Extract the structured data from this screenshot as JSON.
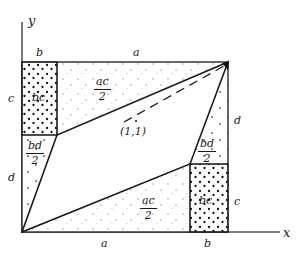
{
  "figure": {
    "axes": {
      "x_label": "x",
      "y_label": "y"
    },
    "point_label": "(1,1)",
    "edge_labels": {
      "top_left": "b",
      "top_right": "a",
      "bottom_left": "a",
      "bottom_right": "b",
      "left_upper": "c",
      "left_lower": "d",
      "right_upper": "d",
      "right_lower": "c"
    },
    "region_labels": {
      "top_left_block": "bc",
      "bottom_right_block": "bc",
      "top_triangle_num": "ac",
      "top_triangle_den": "2",
      "bottom_triangle_num": "ac",
      "bottom_triangle_den": "2",
      "left_triangle_num": "bd",
      "left_triangle_den": "2",
      "right_triangle_num": "bd",
      "right_triangle_den": "2"
    },
    "colors": {
      "stroke": "#1a1a1a",
      "axis": "#555555",
      "background": "#ffffff",
      "dot_dense": "#111111",
      "dot_sparse": "#9a9a9a"
    }
  }
}
